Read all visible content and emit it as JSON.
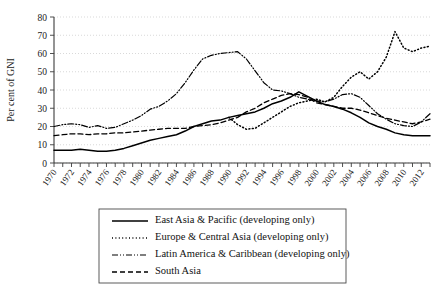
{
  "chart_data": {
    "type": "line",
    "title": "",
    "xlabel": "",
    "ylabel": "Per cent of GNI",
    "ylim": [
      0,
      80
    ],
    "ytick_values": [
      0,
      10,
      20,
      30,
      40,
      50,
      60,
      70,
      80
    ],
    "xlim": [
      1970,
      2013
    ],
    "xtick_labels": [
      "1970",
      "1972",
      "1974",
      "1976",
      "1978",
      "1980",
      "1982",
      "1984",
      "1986",
      "1988",
      "1990",
      "1992",
      "1994",
      "1996",
      "1998",
      "2000",
      "2002",
      "2004",
      "2006",
      "2008",
      "2010",
      "2012"
    ],
    "grid": "horizontal-dotted",
    "legend_position": "below-axes",
    "x": [
      1970,
      1971,
      1972,
      1973,
      1974,
      1975,
      1976,
      1977,
      1978,
      1979,
      1980,
      1981,
      1982,
      1983,
      1984,
      1985,
      1986,
      1987,
      1988,
      1989,
      1990,
      1991,
      1992,
      1993,
      1994,
      1995,
      1996,
      1997,
      1998,
      1999,
      2000,
      2001,
      2002,
      2003,
      2004,
      2005,
      2006,
      2007,
      2008,
      2009,
      2010,
      2011,
      2012,
      2013
    ],
    "series": [
      {
        "name": "East Asia & Pacific (developing only)",
        "linestyle": "solid",
        "color": "#000000",
        "values": [
          7,
          7,
          7,
          7.5,
          7,
          6.5,
          6.5,
          7,
          8,
          9.5,
          11,
          12.5,
          13.5,
          14.5,
          15.5,
          17.5,
          20,
          21.5,
          23,
          23.5,
          25,
          26,
          27,
          28,
          30,
          32.5,
          34,
          36,
          39,
          36.5,
          34,
          32,
          31,
          29.5,
          27.5,
          25,
          22,
          20,
          18.5,
          16.5,
          15.5,
          15,
          15,
          15
        ]
      },
      {
        "name": "Europe & Central Asia (developing only)",
        "linestyle": "dotted",
        "color": "#000000",
        "values": [
          null,
          null,
          null,
          null,
          null,
          null,
          null,
          null,
          null,
          null,
          null,
          null,
          null,
          null,
          null,
          null,
          null,
          null,
          null,
          null,
          25,
          21,
          18.5,
          19,
          22,
          25,
          28,
          31,
          33,
          34,
          35,
          33.5,
          36,
          42,
          47,
          50,
          46,
          50,
          58,
          72,
          63,
          61,
          63,
          64
        ]
      },
      {
        "name": "Latin America & Caribbean (developing only)",
        "linestyle": "dashdotdot",
        "color": "#000000",
        "values": [
          20,
          21,
          21.5,
          21,
          19.5,
          20.5,
          19,
          19.5,
          21.5,
          23.5,
          26,
          29.5,
          31,
          34,
          38,
          44,
          51,
          57,
          59,
          60,
          60.5,
          61,
          57,
          50.5,
          44,
          40,
          39.5,
          38,
          36,
          35,
          34,
          33.5,
          35,
          37.5,
          38,
          36,
          31.5,
          27,
          24,
          21.5,
          20.5,
          20,
          22.5,
          27
        ]
      },
      {
        "name": "South Asia",
        "linestyle": "dashed",
        "color": "#000000",
        "values": [
          15,
          15.5,
          16,
          16,
          15.5,
          16,
          16,
          16.5,
          16.5,
          17,
          17.5,
          18,
          18.5,
          19,
          19,
          19,
          20,
          20.5,
          21,
          22,
          23.5,
          25,
          28,
          30,
          33,
          35,
          37,
          38,
          37.5,
          36,
          33,
          32,
          31,
          30,
          30,
          29,
          27.5,
          26,
          24.5,
          23.5,
          22.5,
          21.5,
          22.5,
          24
        ]
      }
    ]
  },
  "legend": {
    "items": [
      {
        "label": "East Asia & Pacific (developing only)",
        "style": "solid"
      },
      {
        "label": "Europe & Central Asia (developing only)",
        "style": "dotted"
      },
      {
        "label": "Latin America & Caribbean (developing only)",
        "style": "dashdotdot"
      },
      {
        "label": "South Asia",
        "style": "dashed"
      }
    ]
  }
}
